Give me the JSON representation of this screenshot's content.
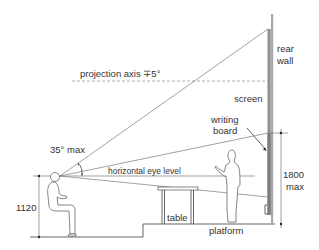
{
  "diagram": {
    "type": "architectural-section",
    "labels": {
      "rear_wall_line1": "rear",
      "rear_wall_line2": "wall",
      "projection_axis": "projection axis ∓5°",
      "screen": "screen",
      "writing_board_line1": "writing",
      "writing_board_line2": "board",
      "angle": "35° max",
      "eye_level": "horizontal eye level",
      "seated_height": "1120",
      "board_height_line1": "1800",
      "board_height_line2": "max",
      "table": "table",
      "platform": "platform"
    },
    "dimensions": {
      "seated_eye_height_mm": 1120,
      "writing_board_max_height_mm": 1800,
      "max_vertical_viewing_angle_deg": 35,
      "projection_axis_tolerance_deg": 5
    },
    "elements": [
      "rear wall",
      "screen",
      "writing board",
      "seated viewer",
      "standing lecturer",
      "table",
      "platform",
      "floor"
    ],
    "colors": {
      "line": "#7a7a7a",
      "text": "#333333",
      "wall": "#9a9a9a",
      "background": "#ffffff"
    }
  }
}
